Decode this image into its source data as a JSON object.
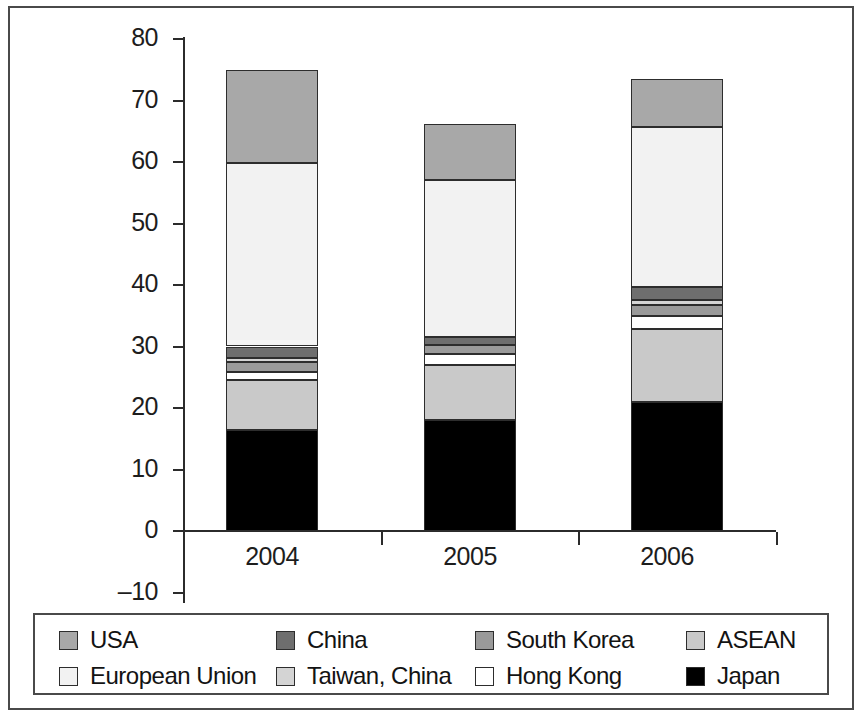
{
  "chart_data": {
    "type": "bar",
    "subtype": "stacked-bar",
    "title": "",
    "subtitle": "",
    "xlabel": "",
    "ylabel": "",
    "categories": [
      "2004",
      "2005",
      "2006"
    ],
    "ylim": [
      -10,
      80
    ],
    "yticks": [
      -10,
      0,
      10,
      20,
      30,
      40,
      50,
      60,
      70,
      80
    ],
    "ytick_labels": [
      "–10",
      "0",
      "10",
      "20",
      "30",
      "40",
      "50",
      "60",
      "70",
      "80"
    ],
    "grid": false,
    "legend_position": "bottom",
    "stack_order_bottom_to_top": [
      "Japan",
      "ASEAN",
      "Hong Kong",
      "South Korea",
      "Taiwan, China",
      "China",
      "European Union",
      "USA"
    ],
    "series": [
      {
        "name": "Japan",
        "color": "#000000",
        "values": [
          16.4,
          18.0,
          21.0
        ]
      },
      {
        "name": "ASEAN",
        "color": "#c9c9c9",
        "values": [
          8.1,
          9.0,
          11.9
        ]
      },
      {
        "name": "Hong Kong",
        "color": "#ffffff",
        "values": [
          1.3,
          1.8,
          2.0
        ]
      },
      {
        "name": "South Korea",
        "color": "#9a9a9a",
        "values": [
          1.6,
          1.5,
          1.8
        ]
      },
      {
        "name": "Taiwan, China",
        "color": "#d4d4d4",
        "values": [
          0.8,
          0.0,
          0.9
        ]
      },
      {
        "name": "China",
        "color": "#6e6e6e",
        "values": [
          1.8,
          1.3,
          2.1
        ]
      },
      {
        "name": "European Union",
        "color": "#f2f2f2",
        "values": [
          29.9,
          25.5,
          26.0
        ]
      },
      {
        "name": "USA",
        "color": "#a8a8a8",
        "values": [
          15.1,
          9.0,
          7.8
        ]
      }
    ],
    "totals": [
      75.0,
      66.0,
      73.5
    ]
  },
  "axis": {
    "y_ticks": [
      {
        "label": "80",
        "value": 80
      },
      {
        "label": "70",
        "value": 70
      },
      {
        "label": "60",
        "value": 60
      },
      {
        "label": "50",
        "value": 50
      },
      {
        "label": "40",
        "value": 40
      },
      {
        "label": "30",
        "value": 30
      },
      {
        "label": "20",
        "value": 20
      },
      {
        "label": "10",
        "value": 10
      },
      {
        "label": "0",
        "value": 0
      },
      {
        "label": "–10",
        "value": -10
      }
    ],
    "x_labels": [
      "2004",
      "2005",
      "2006"
    ]
  },
  "legend": {
    "entries": [
      {
        "label": "USA",
        "color": "#a8a8a8"
      },
      {
        "label": "China",
        "color": "#6e6e6e"
      },
      {
        "label": "South Korea",
        "color": "#9a9a9a"
      },
      {
        "label": "ASEAN",
        "color": "#c9c9c9"
      },
      {
        "label": "European Union",
        "color": "#f2f2f2"
      },
      {
        "label": "Taiwan, China",
        "color": "#d4d4d4"
      },
      {
        "label": "Hong Kong",
        "color": "#ffffff"
      },
      {
        "label": "Japan",
        "color": "#000000"
      }
    ]
  }
}
